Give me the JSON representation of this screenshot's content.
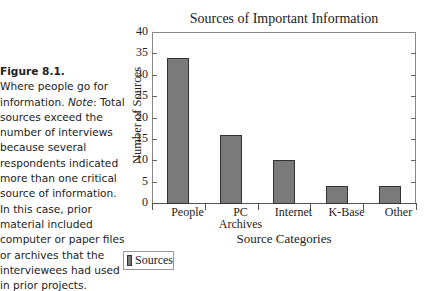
{
  "caption": {
    "figure_label": "Figure 8.1.",
    "text_before_note": "Where people go for information. ",
    "note_label": "Note",
    "text_after_note": ": Total sources exceed the number of interviews because several respondents indicated more than one critical source of information. In this case, prior material included computer or paper files or archives that the interviewees had used in prior projects."
  },
  "chart_data": {
    "type": "bar",
    "title": "Sources of Important Information",
    "xlabel": "Source Categories",
    "ylabel": "Number of Sources",
    "categories": [
      "People",
      "PC Archives",
      "Internet",
      "K-Base",
      "Other"
    ],
    "series": [
      {
        "name": "Sources",
        "values": [
          34,
          16,
          10,
          4,
          4
        ],
        "color": "#7a7a7a"
      }
    ],
    "ylim": [
      0,
      40
    ],
    "yticks": [
      0,
      5,
      10,
      15,
      20,
      25,
      30,
      35,
      40
    ],
    "grid": false,
    "legend_position": "bottom-left"
  },
  "labels": {
    "cat0": "People",
    "cat1a": "PC",
    "cat1b": "Archives",
    "cat2": "Internet",
    "cat3": "K-Base",
    "cat4": "Other",
    "legend": "Sources"
  }
}
